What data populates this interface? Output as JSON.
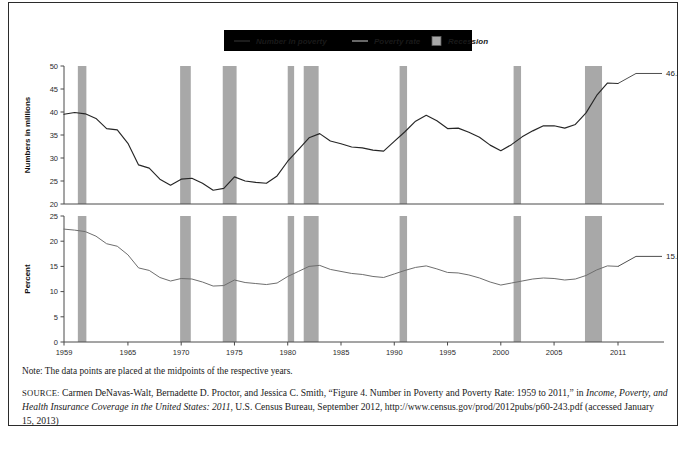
{
  "figure": {
    "clipped_top_caption": "",
    "note": "Note: The data points are placed at the midpoints of the respective years.",
    "source_label": "SOURCE:",
    "source_segments": [
      {
        "text": "Carmen DeNavas-Walt, Bernadette D. Proctor, and Jessica C. Smith, “Figure 4. Number in Poverty and Poverty Rate: 1959 to 2011,” in ",
        "italic": false
      },
      {
        "text": "Income, Poverty, and Health Insurance Coverage in the United States: 2011",
        "italic": true
      },
      {
        "text": ", U.S. Census Bureau, September 2012, http://www.census.gov/prod/2012pubs/p60-243.pdf (accessed January 15, 2013)",
        "italic": false
      }
    ]
  },
  "legend": {
    "items": [
      {
        "label": "Number in poverty",
        "marker": "line-dark",
        "color": "#262626"
      },
      {
        "label": "Poverty rate",
        "marker": "line-light",
        "color": "#8a8a8a"
      },
      {
        "label": "Recession",
        "marker": "box",
        "color": "#a8a8a8"
      }
    ]
  },
  "chart_data": {
    "type": "line",
    "title": "Number in Poverty and Poverty Rate: 1959 to 2011",
    "xlabel": "",
    "grid": false,
    "legend_position": "top-center",
    "x": [
      1959,
      1960,
      1961,
      1962,
      1963,
      1964,
      1965,
      1966,
      1967,
      1968,
      1969,
      1970,
      1971,
      1972,
      1973,
      1974,
      1975,
      1976,
      1977,
      1978,
      1979,
      1980,
      1981,
      1982,
      1983,
      1984,
      1985,
      1986,
      1987,
      1988,
      1989,
      1990,
      1991,
      1992,
      1993,
      1994,
      1995,
      1996,
      1997,
      1998,
      1999,
      2000,
      2001,
      2002,
      2003,
      2004,
      2005,
      2006,
      2007,
      2008,
      2009,
      2010,
      2011
    ],
    "xlim": [
      1959,
      2011
    ],
    "xticks": [
      1959,
      1965,
      1970,
      1975,
      1980,
      1985,
      1990,
      1995,
      2000,
      2005,
      2011
    ],
    "panels": [
      {
        "id": "number-in-poverty",
        "ylabel": "Numbers in millions",
        "ylim": [
          20,
          50
        ],
        "yticks": [
          20,
          25,
          30,
          35,
          40,
          45,
          50
        ],
        "series_name": "Number in poverty",
        "units": "millions",
        "values": [
          39.5,
          39.9,
          39.6,
          38.6,
          36.4,
          36.1,
          33.2,
          28.5,
          27.8,
          25.4,
          24.1,
          25.4,
          25.6,
          24.5,
          23.0,
          23.4,
          25.9,
          25.0,
          24.7,
          24.5,
          26.1,
          29.3,
          31.8,
          34.4,
          35.3,
          33.7,
          33.1,
          32.4,
          32.2,
          31.7,
          31.5,
          33.6,
          35.7,
          38.0,
          39.3,
          38.1,
          36.4,
          36.5,
          35.6,
          34.5,
          32.8,
          31.6,
          32.9,
          34.6,
          35.9,
          37.0,
          37.0,
          36.5,
          37.3,
          39.8,
          43.6,
          46.3,
          46.2
        ],
        "annotation": {
          "text": "46.2 million",
          "x": 2011,
          "y": 46.2
        }
      },
      {
        "id": "poverty-rate",
        "ylabel": "Percent",
        "ylim": [
          0,
          25
        ],
        "yticks": [
          0,
          5,
          10,
          15,
          20,
          25
        ],
        "series_name": "Poverty rate",
        "units": "percent",
        "values": [
          22.4,
          22.2,
          21.9,
          21.0,
          19.5,
          19.0,
          17.3,
          14.7,
          14.2,
          12.8,
          12.1,
          12.6,
          12.5,
          11.9,
          11.1,
          11.2,
          12.3,
          11.8,
          11.6,
          11.4,
          11.7,
          13.0,
          14.0,
          15.0,
          15.2,
          14.4,
          14.0,
          13.6,
          13.4,
          13.0,
          12.8,
          13.5,
          14.2,
          14.8,
          15.1,
          14.5,
          13.8,
          13.7,
          13.3,
          12.7,
          11.9,
          11.3,
          11.7,
          12.1,
          12.5,
          12.7,
          12.6,
          12.3,
          12.5,
          13.2,
          14.3,
          15.1,
          15.0
        ],
        "annotation": {
          "text": "15.0 percent",
          "x": 2011,
          "y": 15.0
        }
      }
    ],
    "recessions": [
      {
        "start": 1960.3,
        "end": 1961.1
      },
      {
        "start": 1969.9,
        "end": 1970.9
      },
      {
        "start": 1973.9,
        "end": 1975.2
      },
      {
        "start": 1980.0,
        "end": 1980.6
      },
      {
        "start": 1981.5,
        "end": 1982.9
      },
      {
        "start": 1990.5,
        "end": 1991.2
      },
      {
        "start": 2001.2,
        "end": 2001.9
      },
      {
        "start": 2007.9,
        "end": 2009.5
      }
    ]
  }
}
